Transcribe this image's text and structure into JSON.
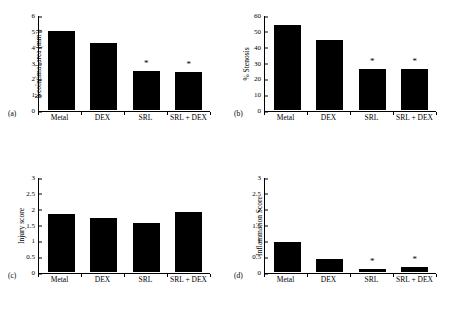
{
  "figure": {
    "categories": [
      "Metal",
      "DEX",
      "SRL",
      "SRL + DEX"
    ]
  },
  "chart_data": [
    {
      "panel": "(a)",
      "type": "bar",
      "title": "",
      "xlabel": "",
      "ylabel": "Neointimal area (mm²)",
      "categories": [
        "Metal",
        "DEX",
        "SRL",
        "SRL + DEX"
      ],
      "values": [
        5.05,
        4.25,
        2.5,
        2.42
      ],
      "ylim": [
        0,
        6
      ],
      "yticks": [
        0,
        1,
        2,
        3,
        4,
        5,
        6
      ],
      "ytick_labels": [
        "0",
        "1",
        "2",
        "3",
        "4",
        "5",
        "6"
      ],
      "annotations": [
        {
          "category": "SRL",
          "text": "*"
        },
        {
          "category": "SRL + DEX",
          "text": "*"
        }
      ],
      "grid": false,
      "legend": "none"
    },
    {
      "panel": "(b)",
      "type": "bar",
      "title": "",
      "xlabel": "",
      "ylabel": "% Stenosis",
      "categories": [
        "Metal",
        "DEX",
        "SRL",
        "SRL + DEX"
      ],
      "values": [
        54.5,
        44.7,
        26.0,
        26.1
      ],
      "ylim": [
        0,
        60
      ],
      "yticks": [
        0,
        10,
        20,
        30,
        40,
        50,
        60
      ],
      "ytick_labels": [
        "0",
        "10",
        "20",
        "30",
        "40",
        "50",
        "60"
      ],
      "annotations": [
        {
          "category": "SRL",
          "text": "*"
        },
        {
          "category": "SRL + DEX",
          "text": "*"
        }
      ],
      "grid": false,
      "legend": "none"
    },
    {
      "panel": "(c)",
      "type": "bar",
      "title": "",
      "xlabel": "",
      "ylabel": "Injury score",
      "categories": [
        "Metal",
        "DEX",
        "SRL",
        "SRL + DEX"
      ],
      "values": [
        1.85,
        1.73,
        1.55,
        1.9
      ],
      "ylim": [
        0,
        3
      ],
      "yticks": [
        0,
        0.5,
        1,
        1.5,
        2,
        2.5,
        3
      ],
      "ytick_labels": [
        "0",
        "0.5",
        "1",
        "1.5",
        "2",
        "2.5",
        "3"
      ],
      "annotations": [],
      "grid": false,
      "legend": "none"
    },
    {
      "panel": "(d)",
      "type": "bar",
      "title": "",
      "xlabel": "",
      "ylabel": "Inflammation Score",
      "categories": [
        "Metal",
        "DEX",
        "SRL",
        "SRL + DEX"
      ],
      "values": [
        0.96,
        0.4,
        0.1,
        0.15
      ],
      "ylim": [
        0,
        3
      ],
      "yticks": [
        0,
        0.5,
        1,
        1.5,
        2,
        2.5,
        3
      ],
      "ytick_labels": [
        "0",
        "0.5",
        "1",
        "1.5",
        "2",
        "2.5",
        "3"
      ],
      "annotations": [
        {
          "category": "SRL",
          "text": "*"
        },
        {
          "category": "SRL + DEX",
          "text": "*"
        }
      ],
      "grid": false,
      "legend": "none"
    }
  ],
  "panels": {
    "a": {
      "letter": "(a)",
      "ylabel": "Neointimal area (mm²)",
      "xticks": [
        "Metal",
        "DEX",
        "SRL",
        "SRL + DEX"
      ]
    },
    "b": {
      "letter": "(b)",
      "ylabel": "% Stenosis",
      "xticks": [
        "Metal",
        "DEX",
        "SRL",
        "SRL + DEX"
      ]
    },
    "c": {
      "letter": "(c)",
      "ylabel": "Injury score",
      "xticks": [
        "Metal",
        "DEX",
        "SRL",
        "SRL + DEX"
      ]
    },
    "d": {
      "letter": "(d)",
      "ylabel": "Inflammation Score",
      "xticks": [
        "Metal",
        "DEX",
        "SRL",
        "SRL + DEX"
      ]
    }
  },
  "colors": {
    "bar": "#000000",
    "axis": "#000000",
    "background": "#ffffff"
  }
}
